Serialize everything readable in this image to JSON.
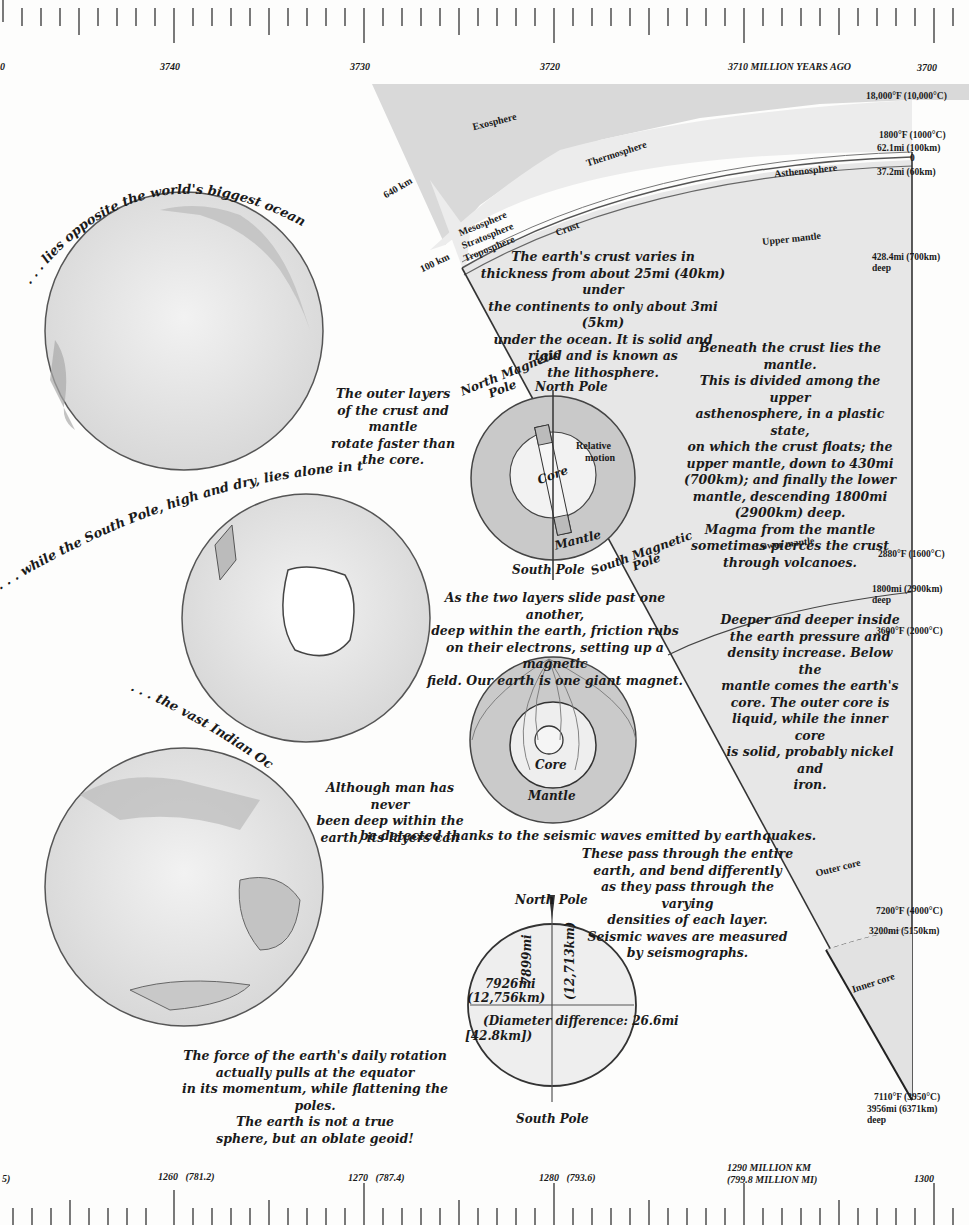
{
  "top_ruler": {
    "labels": [
      {
        "text": "0",
        "x": 0
      },
      {
        "text": "3740",
        "x": 160
      },
      {
        "text": "3730",
        "x": 350
      },
      {
        "text": "3720",
        "x": 543
      },
      {
        "text": "3710 MILLION YEARS AGO",
        "x": 728
      },
      {
        "text": "3700",
        "x": 918
      }
    ]
  },
  "bottom_ruler": {
    "labels": [
      {
        "text": "5)",
        "x": 2
      },
      {
        "text": "1260   (781.2)",
        "x": 160
      },
      {
        "text": "1270   (787.4)",
        "x": 350
      },
      {
        "text": "1280   (793.6)",
        "x": 540
      },
      {
        "text": "1290 MILLION KM",
        "x": 727,
        "line2": "(799.8 MILLION MI)"
      },
      {
        "text": "1300",
        "x": 914
      }
    ]
  },
  "globes": {
    "pacific_caption": ". . . lies opposite the world's biggest ocean, the Pacific.",
    "south_pole_caption": ". . . while the South Pole, high and dry, lies alone in the world ocean.",
    "indian_caption": ". . . the vast Indian Ocean."
  },
  "cross_section": {
    "atmosphere_layers": [
      "Exosphere",
      "Thermosphere",
      "Mesosphere",
      "Stratosphere",
      "Troposphere"
    ],
    "altitude_labels": {
      "a640": "640 km",
      "a100": "100 km"
    },
    "earth_layers": {
      "crust": "Crust",
      "asthenosphere": "Asthenosphere",
      "upper_mantle": "Upper mantle",
      "lower_mantle": "Lower mantle",
      "outer_core": "Outer core",
      "inner_core": "Inner core"
    },
    "right_scale": {
      "t1": "18,000°F (10,000°C)",
      "t2": "1800°F (1000°C)",
      "d1": "62.1mi (100km)",
      "zero": "0",
      "d2": "37.2mi (60km)",
      "d3": "428.4mi (700km)",
      "d3b": "deep",
      "t3": "2880°F (1600°C)",
      "d4": "1800mi (2900km)",
      "d4b": "deep",
      "t4": "3600°F (2000°C)",
      "t5": "7200°F (4000°C)",
      "d5": "3200mi (5150km)",
      "t6": "7110°F (3950°C)",
      "d6": "3956mi (6371km)",
      "d6b": "deep"
    }
  },
  "texts": {
    "crust_para": [
      "The earth's crust varies in",
      "thickness from about 25mi (40km) under",
      "the continents to only about 3mi (5km)",
      "under the ocean. It is solid and",
      "rigid and is known as",
      "the lithosphere."
    ],
    "mantle_para": [
      "Beneath the crust lies the mantle.",
      "This is divided among the upper",
      "asthenosphere, in a plastic state,",
      "on which the crust floats; the",
      "upper mantle, down to 430mi",
      "(700km); and finally the lower",
      "mantle, descending 1800mi",
      "(2900km) deep.",
      "Magma from the mantle",
      "sometimes pierces the crust",
      "through volcanoes."
    ],
    "rotation_para": [
      "The outer layers",
      "of the crust and mantle",
      "rotate faster than",
      "the core."
    ],
    "friction_para": [
      "As the two layers slide past one another,",
      "deep within the earth, friction rubs",
      "on their electrons, setting up a magnetic",
      "field. Our earth is one giant magnet."
    ],
    "core_para": [
      "Deeper and deeper inside",
      "the earth pressure and",
      "density increase. Below the",
      "mantle comes the earth's",
      "core. The outer core is",
      "liquid, while the inner core",
      "is solid, probably nickel and",
      "iron."
    ],
    "seismic_para1": [
      "Although man has never",
      "been deep within the",
      "earth, its layers can"
    ],
    "seismic_para2": "be detected thanks to the seismic waves emitted by earthquakes.",
    "seismic_para3": [
      "These pass through the entire",
      "earth, and bend differently",
      "as they pass through the varying",
      "densities of each layer.",
      "Seismic waves are measured",
      "by seismographs."
    ],
    "geoid_para": [
      "The force of the earth's daily rotation",
      "actually pulls at the equator",
      "in its momentum, while flattening the poles.",
      "The earth is not a true",
      "sphere, but an oblate geoid!"
    ]
  },
  "magnet_diagram": {
    "north_magnetic": "North Magnetic",
    "north_magnetic_2": "Pole",
    "north_pole": "North Pole",
    "relative_motion": "Relative",
    "relative_motion_2": "motion",
    "core": "Core",
    "mantle": "Mantle",
    "south_pole": "South Pole",
    "south_magnetic": "South Magnetic",
    "south_magnetic_2": "Pole"
  },
  "field_diagram": {
    "core": "Core",
    "mantle": "Mantle"
  },
  "geoid_diagram": {
    "north_pole": "North Pole",
    "south_pole": "South Pole",
    "equatorial": "7926mi",
    "equatorial_km": "(12,756km)",
    "polar": "7899mi",
    "polar_km": "(12,713km)",
    "difference": "(Diameter difference: 26.6mi",
    "difference_km": "[42.8km])"
  }
}
